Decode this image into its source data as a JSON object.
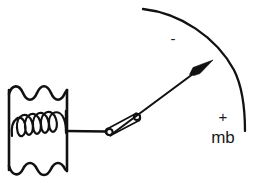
{
  "figure": {
    "background_color": "#ffffff",
    "ink_color": "#111111",
    "width": 254,
    "height": 186
  },
  "scale": {
    "unit_label": "mb",
    "negative_label": "-",
    "positive_label": "+",
    "arc_description": "curved graduated scale arc",
    "unit_label_x": 223,
    "unit_label_y": 137,
    "positive_label_x": 223,
    "positive_label_y": 117,
    "negative_label_x": 173,
    "negative_label_y": 41
  },
  "components": {
    "capsule_name": "aneroid-capsule",
    "spring_name": "internal-spring",
    "linkage_name": "connecting-linkage",
    "pointer_name": "pointer-needle"
  },
  "geometry": {
    "capsule": {
      "left": 8,
      "right": 68,
      "top": 88,
      "bottom": 172,
      "wave_count": 4
    },
    "spring": {
      "loops": 6,
      "left": 12,
      "right": 66,
      "center_y": 126
    },
    "connector": {
      "x1": 68,
      "y1": 131,
      "x2": 108,
      "y2": 131
    },
    "linkage": {
      "lower_joint_x": 109,
      "lower_joint_y": 132,
      "upper_joint_x": 137,
      "upper_joint_y": 117
    },
    "pointer": {
      "tail_x": 112,
      "tail_y": 134,
      "tip_x": 212,
      "tip_y": 61
    },
    "arc": {
      "start_x": 143,
      "start_y": 9,
      "end_x": 245,
      "end_y": 131
    }
  }
}
